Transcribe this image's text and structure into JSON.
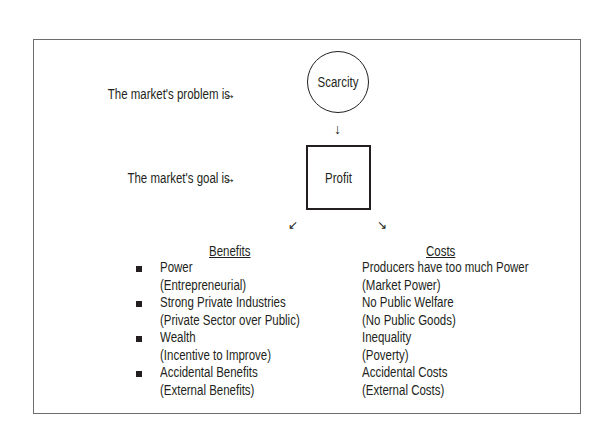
{
  "diagram": {
    "problem_label": "The market's problem is",
    "goal_label": "The market's goal is",
    "problem_node": "Scarcity",
    "goal_node": "Profit",
    "arrows": {
      "right": "→",
      "down": "↓",
      "down_left": "↙",
      "down_right": "↘"
    },
    "benefits": {
      "header": "Benefits",
      "items": [
        {
          "title": "Power",
          "detail": "(Entrepreneurial)"
        },
        {
          "title": "Strong Private Industries",
          "detail": "(Private Sector over Public)"
        },
        {
          "title": "Wealth",
          "detail": "(Incentive to Improve)"
        },
        {
          "title": "Accidental Benefits",
          "detail": "(External Benefits)"
        }
      ]
    },
    "costs": {
      "header": "Costs",
      "items": [
        {
          "title": "Producers have too much Power",
          "detail": "(Market Power)"
        },
        {
          "title": "No Public Welfare",
          "detail": "(No Public Goods)"
        },
        {
          "title": "Inequality",
          "detail": "(Poverty)"
        },
        {
          "title": "Accidental Costs",
          "detail": "(External Costs)"
        }
      ]
    }
  }
}
